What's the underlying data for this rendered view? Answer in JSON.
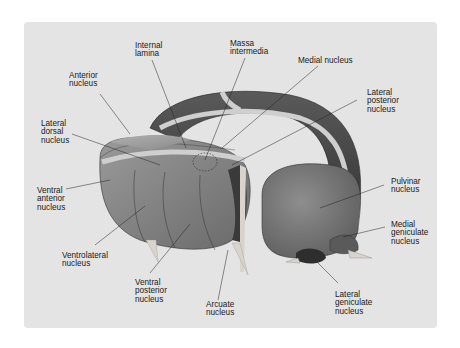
{
  "figure": {
    "background": "#e4e4e4",
    "labels": {
      "internal_lamina": "Internal\nlamina",
      "massa_intermedia": "Massa\nintermedia",
      "medial_nucleus": "Medial nucleus",
      "anterior_nucleus": "Anterior\nnucleus",
      "lateral_posterior_nucleus": "Lateral\nposterior\nnucleus",
      "lateral_dorsal_nucleus": "Lateral\ndorsal\nnucleus",
      "ventral_anterior_nucleus": "Ventral\nanterior\nnucleus",
      "pulvinar_nucleus": "Pulvinar\nnucleus",
      "medial_geniculate_nucleus": "Medial\ngeniculate\nnucleus",
      "ventrolateral_nucleus": "Ventrolateral\nnucleus",
      "ventral_posterior_nucleus": "Ventral\nposterior\nnucleus",
      "arcuate_nucleus": "Arcuate\nnucleus",
      "lateral_geniculate_nucleus": "Lateral\ngeniculate\nnucleus"
    }
  }
}
